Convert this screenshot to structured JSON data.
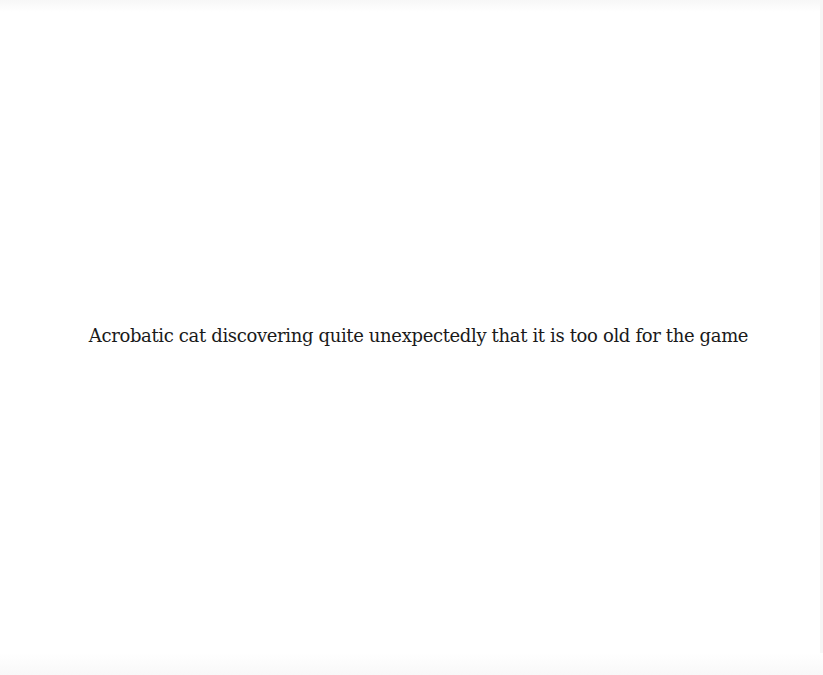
{
  "caption": {
    "text": "Acrobatic cat discovering quite unexpectedly that it is too old for the game"
  },
  "colors": {
    "background": "#ffffff",
    "text": "#1a1a1a"
  }
}
